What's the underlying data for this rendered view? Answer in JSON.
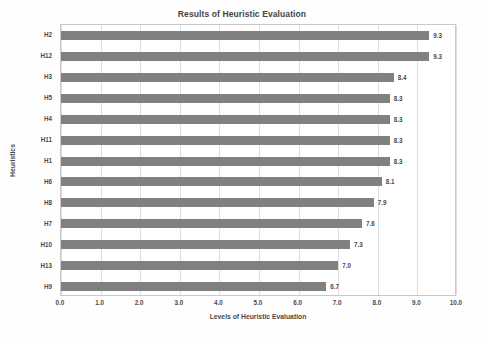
{
  "chart_data": {
    "type": "bar",
    "orientation": "horizontal",
    "title": "Results of Heuristic Evaluation",
    "xlabel": "Levels of Heuristic Evaluation",
    "ylabel": "Heuristics",
    "categories": [
      "H2",
      "H12",
      "H3",
      "H5",
      "H4",
      "H11",
      "H1",
      "H6",
      "H8",
      "H7",
      "H10",
      "H13",
      "H9"
    ],
    "values": [
      9.3,
      9.3,
      8.4,
      8.3,
      8.3,
      8.3,
      8.3,
      8.1,
      7.9,
      7.6,
      7.3,
      7.0,
      6.7
    ],
    "value_labels": [
      "9.3",
      "9.3",
      "8.4",
      "8.3",
      "8.3",
      "8.3",
      "8.3",
      "8.1",
      "7.9",
      "7.6",
      "7.3",
      "7.0",
      "6.7"
    ],
    "xlim": [
      0.0,
      10.0
    ],
    "xticks": [
      0.0,
      1.0,
      2.0,
      3.0,
      4.0,
      5.0,
      6.0,
      7.0,
      8.0,
      9.0,
      10.0
    ],
    "xtick_labels": [
      "0.0",
      "1.0",
      "2.0",
      "3.0",
      "4.0",
      "5.0",
      "6.0",
      "7.0",
      "8.0",
      "9.0",
      "10.0"
    ],
    "grid": "vertical",
    "legend": null,
    "bar_color": "#808080",
    "grid_color": "#dedede",
    "border_color": "#c9c9c9",
    "text_color": "#4a4a4a",
    "background": "#ffffff"
  }
}
